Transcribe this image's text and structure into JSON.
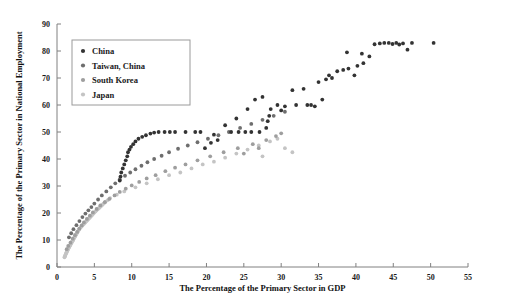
{
  "chart_data": {
    "type": "scatter",
    "title": "",
    "xlabel": "The Percentage of the Primary Sector in GDP",
    "ylabel": "The Percentage of the Primary Sector in National Employment",
    "xlim": [
      0,
      55
    ],
    "ylim": [
      0,
      90
    ],
    "xticks": [
      0,
      5,
      10,
      15,
      20,
      25,
      30,
      35,
      40,
      45,
      50,
      55
    ],
    "yticks": [
      0,
      10,
      20,
      30,
      40,
      50,
      60,
      70,
      80,
      90
    ],
    "grid": false,
    "legend_position": "upper-left",
    "series": [
      {
        "name": "China",
        "color": "#333333",
        "marker": "circle",
        "points": [
          [
            8.4,
            32.0
          ],
          [
            8.5,
            33.5
          ],
          [
            8.6,
            35.0
          ],
          [
            8.8,
            36.5
          ],
          [
            9.0,
            38.0
          ],
          [
            9.2,
            39.5
          ],
          [
            9.4,
            41.0
          ],
          [
            9.5,
            42.5
          ],
          [
            9.7,
            43.5
          ],
          [
            9.9,
            44.5
          ],
          [
            10.2,
            45.5
          ],
          [
            10.5,
            46.5
          ],
          [
            10.9,
            47.5
          ],
          [
            11.4,
            48.2
          ],
          [
            11.9,
            48.8
          ],
          [
            12.5,
            49.4
          ],
          [
            13.0,
            49.8
          ],
          [
            13.6,
            50.0
          ],
          [
            14.4,
            50.0
          ],
          [
            15.1,
            50.0
          ],
          [
            15.8,
            50.0
          ],
          [
            17.2,
            50.0
          ],
          [
            18.5,
            50.0
          ],
          [
            19.2,
            50.0
          ],
          [
            20.6,
            46.0
          ],
          [
            21.5,
            47.0
          ],
          [
            23.3,
            50.0
          ],
          [
            24.3,
            50.0
          ],
          [
            25.2,
            50.0
          ],
          [
            26.0,
            50.0
          ],
          [
            27.1,
            50.0
          ],
          [
            28.0,
            51.5
          ],
          [
            28.2,
            54.0
          ],
          [
            28.4,
            56.0
          ],
          [
            28.6,
            58.5
          ],
          [
            30.0,
            58.0
          ],
          [
            31.5,
            65.5
          ],
          [
            33.5,
            60.0
          ],
          [
            34.0,
            60.0
          ],
          [
            34.5,
            59.5
          ],
          [
            35.5,
            62.0
          ],
          [
            36.0,
            69.5
          ],
          [
            36.4,
            71.0
          ],
          [
            36.8,
            70.0
          ],
          [
            37.5,
            72.5
          ],
          [
            38.3,
            73.0
          ],
          [
            39.0,
            73.5
          ],
          [
            39.8,
            71.0
          ],
          [
            40.2,
            74.5
          ],
          [
            41.0,
            75.5
          ],
          [
            41.8,
            78.0
          ],
          [
            42.5,
            82.5
          ],
          [
            43.2,
            82.8
          ],
          [
            43.8,
            83.0
          ],
          [
            44.4,
            83.0
          ],
          [
            44.9,
            82.6
          ],
          [
            45.4,
            83.0
          ],
          [
            45.8,
            82.4
          ],
          [
            46.3,
            82.8
          ],
          [
            46.9,
            80.5
          ],
          [
            47.5,
            83.0
          ],
          [
            50.4,
            83.0
          ],
          [
            29.5,
            60.0
          ],
          [
            30.5,
            59.5
          ],
          [
            32.0,
            60.0
          ],
          [
            33.0,
            66.0
          ],
          [
            26.5,
            62.0
          ],
          [
            27.5,
            63.0
          ],
          [
            25.5,
            58.5
          ],
          [
            24.0,
            55.0
          ],
          [
            22.5,
            52.5
          ],
          [
            21.0,
            49.0
          ],
          [
            19.8,
            44.0
          ],
          [
            35.0,
            68.5
          ],
          [
            38.8,
            79.5
          ],
          [
            40.8,
            79.0
          ]
        ]
      },
      {
        "name": "Taiwan, China",
        "color": "#6e6e6e",
        "marker": "circle",
        "points": [
          [
            3.0,
            17.0
          ],
          [
            3.4,
            18.5
          ],
          [
            3.8,
            19.8
          ],
          [
            4.2,
            21.0
          ],
          [
            4.6,
            22.2
          ],
          [
            5.0,
            23.5
          ],
          [
            5.5,
            25.0
          ],
          [
            6.0,
            26.5
          ],
          [
            6.6,
            28.0
          ],
          [
            7.2,
            29.5
          ],
          [
            7.8,
            31.0
          ],
          [
            8.4,
            32.5
          ],
          [
            9.1,
            33.8
          ],
          [
            9.8,
            35.0
          ],
          [
            10.5,
            36.2
          ],
          [
            11.3,
            37.5
          ],
          [
            12.1,
            38.8
          ],
          [
            13.0,
            40.0
          ],
          [
            14.0,
            41.2
          ],
          [
            15.0,
            42.5
          ],
          [
            16.2,
            43.8
          ],
          [
            17.5,
            45.0
          ],
          [
            18.8,
            46.2
          ],
          [
            20.2,
            47.5
          ],
          [
            21.6,
            48.8
          ],
          [
            23.0,
            50.0
          ],
          [
            24.5,
            51.5
          ],
          [
            26.0,
            53.0
          ],
          [
            27.5,
            54.5
          ],
          [
            29.0,
            56.0
          ],
          [
            30.5,
            57.5
          ],
          [
            2.6,
            15.5
          ],
          [
            2.2,
            14.0
          ],
          [
            1.9,
            12.5
          ],
          [
            1.6,
            11.0
          ]
        ]
      },
      {
        "name": "South Korea",
        "color": "#9e9e9e",
        "marker": "circle",
        "points": [
          [
            1.8,
            9.0
          ],
          [
            2.1,
            10.5
          ],
          [
            2.4,
            11.8
          ],
          [
            2.7,
            13.0
          ],
          [
            3.0,
            14.2
          ],
          [
            3.3,
            15.4
          ],
          [
            3.6,
            16.5
          ],
          [
            4.0,
            17.8
          ],
          [
            4.4,
            19.0
          ],
          [
            4.8,
            20.2
          ],
          [
            5.3,
            21.5
          ],
          [
            5.8,
            22.8
          ],
          [
            6.4,
            24.0
          ],
          [
            7.0,
            25.2
          ],
          [
            7.7,
            26.5
          ],
          [
            8.4,
            27.8
          ],
          [
            9.2,
            29.0
          ],
          [
            10.0,
            30.2
          ],
          [
            11.0,
            31.5
          ],
          [
            12.0,
            32.8
          ],
          [
            13.2,
            34.0
          ],
          [
            14.5,
            35.5
          ],
          [
            15.8,
            36.8
          ],
          [
            17.2,
            38.0
          ],
          [
            18.8,
            39.5
          ],
          [
            20.5,
            41.0
          ],
          [
            22.3,
            42.5
          ],
          [
            24.2,
            44.0
          ],
          [
            26.2,
            45.5
          ],
          [
            28.0,
            47.0
          ],
          [
            29.3,
            48.5
          ],
          [
            30.0,
            49.5
          ],
          [
            1.5,
            7.8
          ],
          [
            1.3,
            6.6
          ],
          [
            27.0,
            44.0
          ],
          [
            25.0,
            42.0
          ]
        ]
      },
      {
        "name": "Japan",
        "color": "#c4c4c4",
        "marker": "circle",
        "points": [
          [
            1.1,
            4.2
          ],
          [
            1.2,
            5.0
          ],
          [
            1.3,
            5.6
          ],
          [
            1.4,
            6.2
          ],
          [
            1.5,
            6.8
          ],
          [
            1.6,
            7.3
          ],
          [
            1.7,
            7.8
          ],
          [
            1.8,
            8.3
          ],
          [
            1.9,
            8.8
          ],
          [
            2.0,
            9.3
          ],
          [
            2.1,
            9.8
          ],
          [
            2.2,
            10.3
          ],
          [
            2.3,
            10.8
          ],
          [
            2.4,
            11.3
          ],
          [
            2.5,
            11.8
          ],
          [
            2.6,
            12.2
          ],
          [
            2.7,
            12.7
          ],
          [
            2.8,
            13.2
          ],
          [
            2.9,
            13.7
          ],
          [
            3.0,
            14.2
          ],
          [
            3.2,
            14.8
          ],
          [
            3.4,
            15.4
          ],
          [
            3.6,
            16.0
          ],
          [
            3.8,
            16.6
          ],
          [
            4.0,
            17.2
          ],
          [
            4.2,
            17.8
          ],
          [
            4.4,
            18.4
          ],
          [
            4.6,
            19.0
          ],
          [
            4.8,
            19.6
          ],
          [
            5.0,
            20.2
          ],
          [
            5.3,
            21.0
          ],
          [
            5.6,
            21.8
          ],
          [
            5.9,
            22.6
          ],
          [
            6.2,
            23.4
          ],
          [
            6.5,
            24.2
          ],
          [
            1.0,
            3.6
          ],
          [
            1.05,
            4.0
          ],
          [
            1.15,
            4.6
          ],
          [
            1.25,
            5.2
          ],
          [
            1.35,
            5.8
          ],
          [
            1.45,
            6.4
          ],
          [
            1.55,
            7.0
          ],
          [
            1.65,
            7.5
          ],
          [
            1.75,
            8.0
          ],
          [
            1.85,
            8.5
          ],
          [
            2.05,
            9.5
          ],
          [
            2.15,
            10.0
          ],
          [
            2.35,
            11.0
          ],
          [
            2.55,
            12.0
          ],
          [
            2.75,
            13.0
          ],
          [
            2.95,
            14.0
          ],
          [
            3.1,
            14.5
          ],
          [
            3.3,
            15.1
          ],
          [
            3.5,
            15.7
          ],
          [
            3.7,
            16.3
          ],
          [
            3.9,
            16.9
          ],
          [
            4.1,
            17.5
          ],
          [
            4.3,
            18.1
          ],
          [
            4.5,
            18.7
          ],
          [
            4.7,
            19.3
          ],
          [
            4.9,
            19.9
          ],
          [
            5.15,
            20.6
          ],
          [
            5.45,
            21.4
          ],
          [
            5.75,
            22.2
          ],
          [
            6.05,
            23.0
          ],
          [
            6.35,
            23.8
          ],
          [
            6.8,
            24.8
          ],
          [
            7.1,
            25.5
          ],
          [
            12.0,
            31.0
          ],
          [
            13.5,
            32.5
          ],
          [
            15.0,
            34.0
          ],
          [
            16.5,
            35.0
          ],
          [
            18.0,
            36.5
          ],
          [
            19.5,
            38.0
          ],
          [
            21.0,
            39.0
          ],
          [
            22.5,
            40.5
          ],
          [
            24.0,
            42.0
          ],
          [
            25.5,
            43.5
          ],
          [
            27.0,
            45.0
          ],
          [
            28.5,
            46.5
          ],
          [
            29.5,
            47.5
          ],
          [
            10.5,
            29.5
          ],
          [
            9.0,
            28.0
          ],
          [
            8.0,
            26.8
          ],
          [
            30.5,
            44.0
          ],
          [
            31.5,
            42.5
          ],
          [
            27.5,
            41.0
          ]
        ]
      }
    ]
  },
  "legend": {
    "items": [
      {
        "label": "China"
      },
      {
        "label": "Taiwan, China"
      },
      {
        "label": "South Korea"
      },
      {
        "label": "Japan"
      }
    ]
  }
}
